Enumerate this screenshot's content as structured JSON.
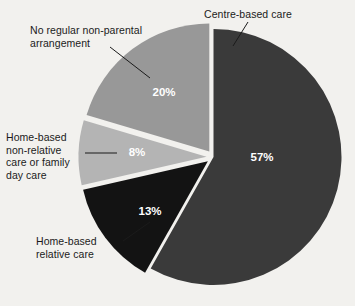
{
  "chart_data": {
    "type": "pie",
    "title": "",
    "subtitle": "",
    "xlabel": "",
    "ylabel": "",
    "legend_position": "callout-labels",
    "grid": false,
    "units": "percent",
    "background_color": "#f2f1ee",
    "categories": [
      "Centre-based care",
      "Home-based relative care",
      "Home-based non-relative care or family day care",
      "No regular non-parental arrangement"
    ],
    "values": [
      57,
      13,
      8,
      20
    ],
    "slices": [
      {
        "label": "Centre-based care",
        "label_lines": "Centre-based care",
        "value": 57,
        "value_text": "57%",
        "color": "#3a3a3a",
        "value_text_color": "#ffffff",
        "exploded": false,
        "start_angle_deg": 0,
        "end_angle_deg": 205.2
      },
      {
        "label": "Home-based relative care",
        "label_lines": "Home-based\nrelative care",
        "value": 13,
        "value_text": "13%",
        "color": "#131313",
        "value_text_color": "#ffffff",
        "exploded": true,
        "start_angle_deg": 205.2,
        "end_angle_deg": 252.0
      },
      {
        "label": "Home-based non-relative care or family day care",
        "label_lines": "Home-based\nnon-relative\ncare or family\nday care",
        "value": 8,
        "value_text": "8%",
        "color": "#b4b4b4",
        "value_text_color": "#ffffff",
        "exploded": true,
        "start_angle_deg": 252.0,
        "end_angle_deg": 280.8
      },
      {
        "label": "No regular non-parental arrangement",
        "label_lines": "No regular non-parental\narrangement",
        "value": 20,
        "value_text": "20%",
        "color": "#989898",
        "value_text_color": "#ffffff",
        "exploded": true,
        "start_angle_deg": 280.8,
        "end_angle_deg": 360.0
      }
    ]
  },
  "labels": {
    "centre_based": "Centre-based care",
    "no_regular": "No regular non-parental\narrangement",
    "home_non_relative": "Home-based\nnon-relative\ncare or family\nday care",
    "home_relative": "Home-based\nrelative care"
  },
  "values": {
    "centre_based": "57%",
    "no_regular": "20%",
    "home_non_relative": "8%",
    "home_relative": "13%"
  }
}
